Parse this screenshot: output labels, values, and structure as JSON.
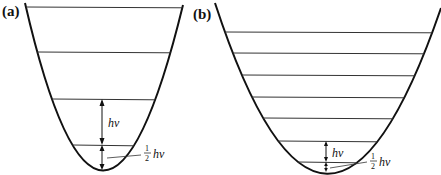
{
  "panels": [
    {
      "id": "a",
      "label": "(a)",
      "description": "Widely spaced vibrational energy levels in a narrow harmonic potential",
      "level_count": 4,
      "quantum_label": "hν",
      "zero_point": {
        "numerator": "1",
        "denominator": "2",
        "unit": "hν"
      }
    },
    {
      "id": "b",
      "label": "(b)",
      "description": "Closely spaced vibrational energy levels in a wide harmonic potential",
      "level_count": 7,
      "quantum_label": "hν",
      "zero_point": {
        "numerator": "1",
        "denominator": "2",
        "unit": "hν"
      }
    }
  ],
  "colors": {
    "stroke": "#111111",
    "level": "#333333",
    "background": "#ffffff"
  }
}
